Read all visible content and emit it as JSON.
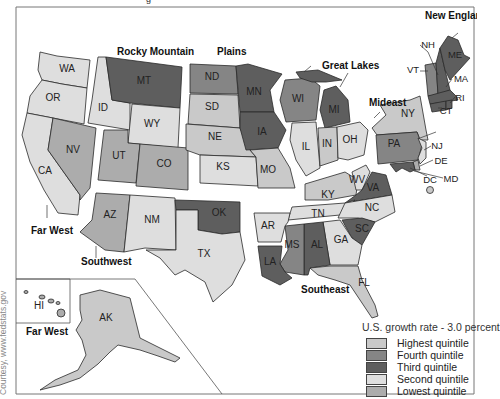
{
  "top_fragment": "g",
  "regions": {
    "far_west": "Far West",
    "rocky_mountain": "Rocky Mountain",
    "plains": "Plains",
    "great_lakes": "Great Lakes",
    "new_england": "New England",
    "mideast": "Mideast",
    "southwest": "Southwest",
    "southeast": "Southeast",
    "far_west_inset": "Far West"
  },
  "colors": {
    "highest": "#c9c9c9",
    "fourth": "#858585",
    "third": "#5e5e5e",
    "second": "#dedede",
    "lowest": "#acacac"
  },
  "states": {
    "WA": {
      "label": "WA",
      "quintile": "second"
    },
    "OR": {
      "label": "OR",
      "quintile": "second"
    },
    "CA": {
      "label": "CA",
      "quintile": "second"
    },
    "NV": {
      "label": "NV",
      "quintile": "lowest"
    },
    "ID": {
      "label": "ID",
      "quintile": "second"
    },
    "MT": {
      "label": "MT",
      "quintile": "third"
    },
    "WY": {
      "label": "WY",
      "quintile": "second"
    },
    "UT": {
      "label": "UT",
      "quintile": "lowest"
    },
    "CO": {
      "label": "CO",
      "quintile": "lowest"
    },
    "AZ": {
      "label": "AZ",
      "quintile": "lowest"
    },
    "NM": {
      "label": "NM",
      "quintile": "second"
    },
    "TX": {
      "label": "TX",
      "quintile": "second"
    },
    "OK": {
      "label": "OK",
      "quintile": "third"
    },
    "ND": {
      "label": "ND",
      "quintile": "fourth"
    },
    "SD": {
      "label": "SD",
      "quintile": "highest"
    },
    "NE": {
      "label": "NE",
      "quintile": "highest"
    },
    "KS": {
      "label": "KS",
      "quintile": "second"
    },
    "MN": {
      "label": "MN",
      "quintile": "third"
    },
    "IA": {
      "label": "IA",
      "quintile": "third"
    },
    "MO": {
      "label": "MO",
      "quintile": "highest"
    },
    "WI": {
      "label": "WI",
      "quintile": "fourth"
    },
    "MI": {
      "label": "MI",
      "quintile": "third"
    },
    "IL": {
      "label": "IL",
      "quintile": "second"
    },
    "IN": {
      "label": "IN",
      "quintile": "highest"
    },
    "OH": {
      "label": "OH",
      "quintile": "second"
    },
    "KY": {
      "label": "KY",
      "quintile": "highest"
    },
    "WV": {
      "label": "WV",
      "quintile": "second"
    },
    "VA": {
      "label": "VA",
      "quintile": "third"
    },
    "TN": {
      "label": "TN",
      "quintile": "second"
    },
    "NC": {
      "label": "NC",
      "quintile": "second"
    },
    "SC": {
      "label": "SC",
      "quintile": "third"
    },
    "AR": {
      "label": "AR",
      "quintile": "second"
    },
    "LA": {
      "label": "LA",
      "quintile": "third"
    },
    "MS": {
      "label": "MS",
      "quintile": "fourth"
    },
    "AL": {
      "label": "AL",
      "quintile": "third"
    },
    "GA": {
      "label": "GA",
      "quintile": "second"
    },
    "FL": {
      "label": "FL",
      "quintile": "highest"
    },
    "NY": {
      "label": "NY",
      "quintile": "highest"
    },
    "PA": {
      "label": "PA",
      "quintile": "fourth"
    },
    "NJ": {
      "label": "NJ",
      "quintile": "second"
    },
    "DE": {
      "label": "DE",
      "quintile": "lowest"
    },
    "MD": {
      "label": "MD",
      "quintile": "third"
    },
    "DC": {
      "label": "DC",
      "quintile": "highest"
    },
    "ME": {
      "label": "ME",
      "quintile": "third"
    },
    "NH": {
      "label": "NH",
      "quintile": "third"
    },
    "VT": {
      "label": "VT",
      "quintile": "fourth"
    },
    "MA": {
      "label": "MA",
      "quintile": "third"
    },
    "RI": {
      "label": "RI",
      "quintile": "third"
    },
    "CT": {
      "label": "CT",
      "quintile": "third"
    },
    "AK": {
      "label": "AK",
      "quintile": "highest"
    },
    "HI": {
      "label": "HI",
      "quintile": "lowest"
    }
  },
  "legend": {
    "title": "U.S. growth rate - 3.0 percent",
    "items": [
      {
        "label": "Highest quintile",
        "key": "highest"
      },
      {
        "label": "Fourth quintile",
        "key": "fourth"
      },
      {
        "label": "Third quintile",
        "key": "third"
      },
      {
        "label": "Second quintile",
        "key": "second"
      },
      {
        "label": "Lowest quintile",
        "key": "lowest"
      }
    ]
  },
  "credit": "Courtesy, www.fedstats.gov"
}
